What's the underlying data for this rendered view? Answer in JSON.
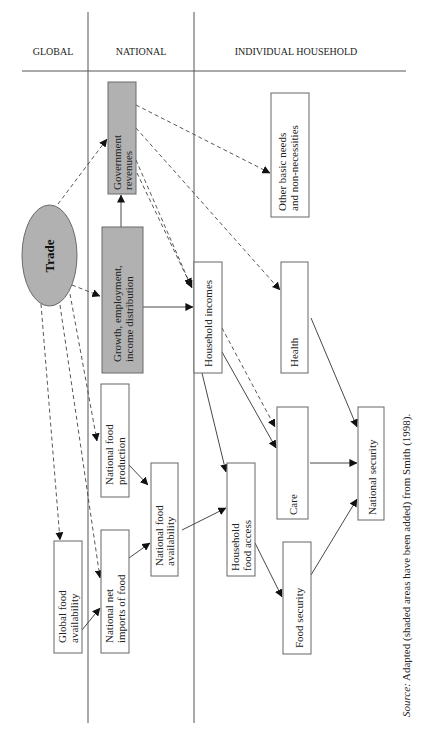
{
  "headers": {
    "global": "GLOBAL",
    "national": "NATIONAL",
    "household": "INDIVIDUAL HOUSEHOLD"
  },
  "nodes": {
    "trade": {
      "label": "Trade",
      "shape": "ellipse",
      "shaded": true,
      "level": "global"
    },
    "government_revenues": {
      "lines": [
        "Government",
        "revenues"
      ],
      "shaded": true,
      "level": "national"
    },
    "growth": {
      "lines": [
        "Growth, employment,",
        "income distribution"
      ],
      "shaded": true,
      "level": "national"
    },
    "national_food_production": {
      "lines": [
        "National food",
        "production"
      ],
      "shaded": false,
      "level": "national"
    },
    "national_food_availability": {
      "lines": [
        "National food",
        "availability"
      ],
      "shaded": false,
      "level": "national"
    },
    "national_net_imports": {
      "lines": [
        "National net",
        "imports of food"
      ],
      "shaded": false,
      "level": "national"
    },
    "global_food_availability": {
      "lines": [
        "Global food",
        "availability"
      ],
      "shaded": false,
      "level": "global"
    },
    "household_incomes": {
      "lines": [
        "Household incomes"
      ],
      "shaded": false,
      "level": "household"
    },
    "health": {
      "lines": [
        "Health"
      ],
      "shaded": false,
      "level": "household"
    },
    "other_basic_needs": {
      "lines": [
        "Other basic needs",
        "and non-necessities"
      ],
      "shaded": false,
      "level": "household"
    },
    "care": {
      "lines": [
        "Care"
      ],
      "shaded": false,
      "level": "household"
    },
    "household_food_access": {
      "lines": [
        "Household",
        "food access"
      ],
      "shaded": false,
      "level": "household"
    },
    "food_security": {
      "lines": [
        "Food security"
      ],
      "shaded": false,
      "level": "household"
    },
    "national_security": {
      "lines": [
        "National security"
      ],
      "shaded": false,
      "level": "household"
    }
  },
  "edges": [
    {
      "from": "trade",
      "to": "government_revenues",
      "style": "dashed"
    },
    {
      "from": "trade",
      "to": "growth",
      "style": "dashed"
    },
    {
      "from": "trade",
      "to": "national_food_production",
      "style": "dashed"
    },
    {
      "from": "trade",
      "to": "national_net_imports",
      "style": "dashed"
    },
    {
      "from": "trade",
      "to": "global_food_availability",
      "style": "dashed"
    },
    {
      "from": "growth",
      "to": "government_revenues",
      "style": "solid"
    },
    {
      "from": "growth",
      "to": "household_incomes",
      "style": "solid"
    },
    {
      "from": "government_revenues",
      "to": "other_basic_needs",
      "style": "dashed"
    },
    {
      "from": "government_revenues",
      "to": "health",
      "style": "dashed"
    },
    {
      "from": "government_revenues",
      "to": "household_incomes",
      "style": "dashed"
    },
    {
      "from": "government_revenues",
      "to": "household_incomes",
      "style": "dashed"
    },
    {
      "from": "household_incomes",
      "to": "care",
      "style": "dashed"
    },
    {
      "from": "household_incomes",
      "to": "care",
      "style": "solid"
    },
    {
      "from": "household_incomes",
      "to": "household_food_access",
      "style": "solid"
    },
    {
      "from": "health",
      "to": "national_security",
      "style": "solid"
    },
    {
      "from": "care",
      "to": "national_security",
      "style": "solid"
    },
    {
      "from": "food_security",
      "to": "national_security",
      "style": "solid"
    },
    {
      "from": "household_food_access",
      "to": "food_security",
      "style": "solid"
    },
    {
      "from": "national_food_availability",
      "to": "household_food_access",
      "style": "solid"
    },
    {
      "from": "national_food_production",
      "to": "national_food_availability",
      "style": "solid"
    },
    {
      "from": "national_net_imports",
      "to": "national_food_availability",
      "style": "solid"
    },
    {
      "from": "global_food_availability",
      "to": "national_net_imports",
      "style": "solid"
    }
  ],
  "source": {
    "prefix": "Source:",
    "text": " Adapted (shaded areas have been added) from Smith (1998)."
  },
  "colors": {
    "shaded_fill": "#b1b1b1",
    "box_border": "#666666",
    "line": "#333333",
    "background": "#ffffff"
  }
}
